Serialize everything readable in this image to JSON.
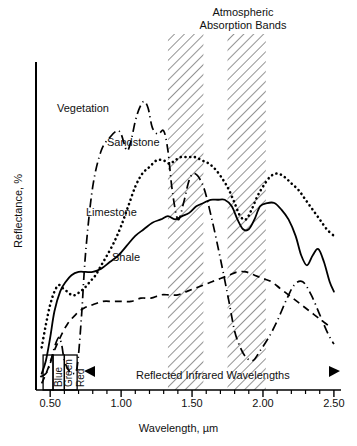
{
  "chart_data": {
    "type": "line",
    "title": "",
    "xlabel": "Wavelength, µm",
    "ylabel": "Reflectance, %",
    "xlim": [
      0.4,
      2.55
    ],
    "ylim": [
      0,
      100
    ],
    "grid": false,
    "legend_position": "inline-curve-labels",
    "xticks_major": [
      0.5,
      1.0,
      1.5,
      2.0,
      2.5
    ],
    "xtick_labels": [
      "0.50",
      "1.00",
      "1.50",
      "2.00",
      "2.50"
    ],
    "xticks_minor": [
      0.6,
      0.7,
      0.8,
      0.9,
      1.1,
      1.2,
      1.3,
      1.4,
      1.6,
      1.7,
      1.8,
      1.9,
      2.1,
      2.2,
      2.3,
      2.4
    ],
    "annotations": {
      "absorption_title": "Atmospheric\nAbsorption Bands",
      "infrared_span": "Reflected Infrared Wavelengths"
    },
    "absorption_bands": [
      {
        "from": 1.33,
        "to": 1.58
      },
      {
        "from": 1.75,
        "to": 2.02
      }
    ],
    "spectral_bands": [
      {
        "label": "Blue",
        "from": 0.45,
        "to": 0.52
      },
      {
        "label": "Green",
        "from": 0.52,
        "to": 0.6
      },
      {
        "label": "Red",
        "from": 0.6,
        "to": 0.69
      }
    ],
    "series": [
      {
        "name": "Vegetation",
        "style": "dash-dot",
        "x": [
          0.43,
          0.47,
          0.5,
          0.53,
          0.56,
          0.58,
          0.6,
          0.63,
          0.66,
          0.69,
          0.72,
          0.75,
          0.8,
          0.86,
          0.92,
          0.97,
          1.0,
          1.04,
          1.07,
          1.1,
          1.13,
          1.16,
          1.19,
          1.22,
          1.26,
          1.3,
          1.33,
          1.36,
          1.4,
          1.44,
          1.48,
          1.52,
          1.58,
          1.64,
          1.7,
          1.76,
          1.8,
          1.84,
          1.88,
          1.93,
          1.98,
          2.04,
          2.1,
          2.16,
          2.22,
          2.28,
          2.34,
          2.4,
          2.46,
          2.5
        ],
        "y": [
          4,
          5,
          8,
          13,
          16,
          14,
          9,
          6,
          5,
          7,
          22,
          42,
          62,
          73,
          77,
          79,
          78,
          73,
          76,
          82,
          86,
          88,
          86,
          80,
          78,
          79,
          73,
          61,
          52,
          57,
          64,
          66,
          62,
          52,
          40,
          27,
          18,
          13,
          10,
          9,
          12,
          16,
          21,
          27,
          32,
          33,
          29,
          23,
          17,
          14
        ]
      },
      {
        "name": "Sandstone",
        "style": "dotted",
        "x": [
          0.44,
          0.47,
          0.5,
          0.53,
          0.56,
          0.59,
          0.62,
          0.65,
          0.68,
          0.71,
          0.74,
          0.78,
          0.82,
          0.86,
          0.9,
          0.95,
          1.0,
          1.05,
          1.1,
          1.15,
          1.2,
          1.25,
          1.3,
          1.34,
          1.38,
          1.42,
          1.47,
          1.52,
          1.57,
          1.62,
          1.67,
          1.72,
          1.76,
          1.8,
          1.84,
          1.88,
          1.92,
          1.96,
          2.0,
          2.05,
          2.1,
          2.15,
          2.2,
          2.25,
          2.3,
          2.35,
          2.4,
          2.45,
          2.5
        ],
        "y": [
          13,
          20,
          26,
          30,
          32,
          31,
          30,
          29,
          29,
          30,
          31,
          33,
          35,
          38,
          41,
          45,
          50,
          56,
          62,
          66,
          68,
          70,
          70,
          69,
          70,
          71,
          71,
          71,
          70,
          69,
          67,
          64,
          61,
          57,
          53,
          52,
          55,
          59,
          62,
          65,
          66,
          65,
          63,
          61,
          58,
          55,
          52,
          49,
          47
        ]
      },
      {
        "name": "Limestone",
        "style": "solid",
        "x": [
          0.44,
          0.47,
          0.5,
          0.53,
          0.57,
          0.61,
          0.65,
          0.7,
          0.75,
          0.8,
          0.86,
          0.92,
          0.98,
          1.04,
          1.1,
          1.16,
          1.22,
          1.28,
          1.33,
          1.38,
          1.43,
          1.48,
          1.53,
          1.58,
          1.63,
          1.68,
          1.73,
          1.78,
          1.82,
          1.86,
          1.9,
          1.94,
          1.98,
          2.03,
          2.08,
          2.13,
          2.18,
          2.23,
          2.27,
          2.31,
          2.35,
          2.39,
          2.43,
          2.47,
          2.5
        ],
        "y": [
          5,
          9,
          16,
          24,
          30,
          33,
          35,
          36,
          36,
          36,
          37,
          39,
          41,
          44,
          47,
          49,
          51,
          52,
          53,
          52,
          53,
          54,
          56,
          57,
          58,
          58,
          58,
          56,
          52,
          49,
          49,
          52,
          56,
          57,
          57,
          55,
          52,
          47,
          41,
          38,
          41,
          43,
          39,
          33,
          30
        ]
      },
      {
        "name": "Shale",
        "style": "dashed",
        "x": [
          0.44,
          0.48,
          0.52,
          0.57,
          0.62,
          0.68,
          0.74,
          0.8,
          0.87,
          0.94,
          1.0,
          1.07,
          1.14,
          1.21,
          1.28,
          1.34,
          1.4,
          1.46,
          1.52,
          1.58,
          1.64,
          1.7,
          1.76,
          1.82,
          1.88,
          1.94,
          2.0,
          2.06,
          2.12,
          2.18,
          2.24,
          2.3,
          2.36,
          2.42,
          2.48
        ],
        "y": [
          2,
          6,
          11,
          16,
          20,
          23,
          25,
          26,
          27,
          27,
          27,
          27,
          28,
          28,
          29,
          29,
          29,
          30,
          31,
          32,
          33,
          34,
          35,
          36,
          36,
          35,
          34,
          33,
          31,
          29,
          27,
          25,
          23,
          21,
          19
        ]
      }
    ]
  }
}
